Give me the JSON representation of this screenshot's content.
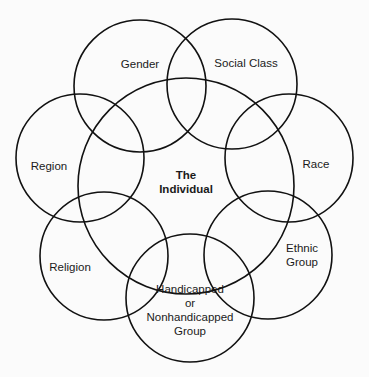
{
  "diagram": {
    "type": "overlapping-circles",
    "center": {
      "label_lines": [
        "The",
        "Individual"
      ],
      "cx": 186,
      "cy": 186,
      "r": 108
    },
    "circles": [
      {
        "id": "gender",
        "label_lines": [
          "Gender"
        ],
        "cx": 140,
        "cy": 86,
        "r": 66,
        "lx": 140,
        "ly": 64
      },
      {
        "id": "social-class",
        "label_lines": [
          "Social Class"
        ],
        "cx": 232,
        "cy": 84,
        "r": 65,
        "lx": 246,
        "ly": 63
      },
      {
        "id": "region",
        "label_lines": [
          "Region"
        ],
        "cx": 80,
        "cy": 158,
        "r": 64,
        "lx": 49,
        "ly": 166
      },
      {
        "id": "race",
        "label_lines": [
          "Race"
        ],
        "cx": 289,
        "cy": 158,
        "r": 64,
        "lx": 316,
        "ly": 164
      },
      {
        "id": "religion",
        "label_lines": [
          "Religion"
        ],
        "cx": 104,
        "cy": 256,
        "r": 64,
        "lx": 70,
        "ly": 267
      },
      {
        "id": "ethnic-group",
        "label_lines": [
          "Ethnic",
          "Group"
        ],
        "cx": 268,
        "cy": 255,
        "r": 64,
        "lx": 302,
        "ly": 255
      },
      {
        "id": "handicapped",
        "label_lines": [
          "Handicapped",
          "or",
          "Nonhandicapped",
          "Group"
        ],
        "cx": 190,
        "cy": 298,
        "r": 64,
        "lx": 190,
        "ly": 310
      }
    ]
  }
}
